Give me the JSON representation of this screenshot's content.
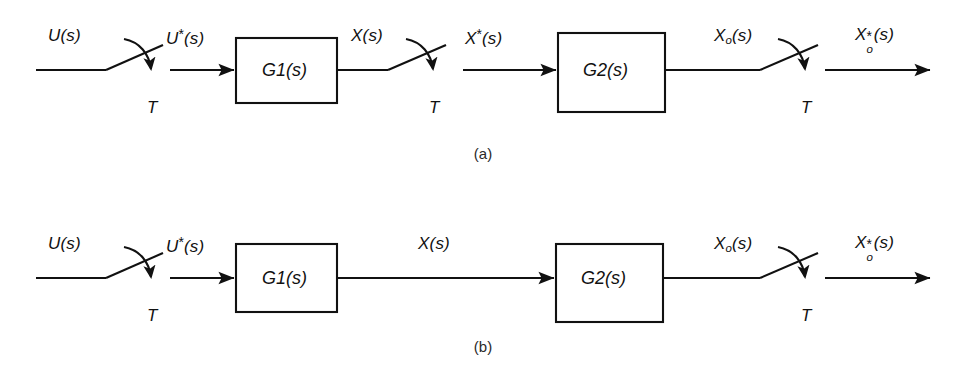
{
  "figure": {
    "type": "block-diagram",
    "line_color": "#111111",
    "background_color": "#ffffff",
    "captions": [
      {
        "id": "a",
        "text": "(a)"
      },
      {
        "id": "b",
        "text": "(b)"
      }
    ]
  },
  "diagram_a": {
    "caption": "(a)",
    "signals": {
      "input": "U(s)",
      "input_sampled": "U*(s)",
      "mid": "X(s)",
      "mid_sampled": "X*(s)",
      "output": "Xo(s)",
      "output_sampled": "Xo*(s)"
    },
    "blocks": [
      {
        "name": "G1",
        "label": "G1(s)",
        "base": "G",
        "sub": "1",
        "arg": "(s)"
      },
      {
        "name": "G2",
        "label": "G2(s)",
        "base": "G",
        "sub": "2",
        "arg": "(s)"
      }
    ],
    "samplers": [
      {
        "name": "sampler-input",
        "period_label": "T"
      },
      {
        "name": "sampler-mid",
        "period_label": "T"
      },
      {
        "name": "sampler-output",
        "period_label": "T"
      }
    ],
    "sampler_count": 3
  },
  "diagram_b": {
    "caption": "(b)",
    "signals": {
      "input": "U(s)",
      "input_sampled": "U*(s)",
      "mid": "X(s)",
      "output": "Xo(s)",
      "output_sampled": "Xo*(s)"
    },
    "blocks": [
      {
        "name": "G1",
        "label": "G1(s)",
        "base": "G",
        "sub": "1",
        "arg": "(s)"
      },
      {
        "name": "G2",
        "label": "G2(s)",
        "base": "G",
        "sub": "2",
        "arg": "(s)"
      }
    ],
    "samplers": [
      {
        "name": "sampler-input",
        "period_label": "T"
      },
      {
        "name": "sampler-output",
        "period_label": "T"
      }
    ],
    "sampler_count": 2
  },
  "text": {
    "U": "U",
    "X": "X",
    "G": "G",
    "T": "T",
    "paren_s": "(s)",
    "star": "*",
    "sub_o": "o",
    "sub_1": "1",
    "sub_2": "2",
    "caption_a": "(a)",
    "caption_b": "(b)"
  }
}
